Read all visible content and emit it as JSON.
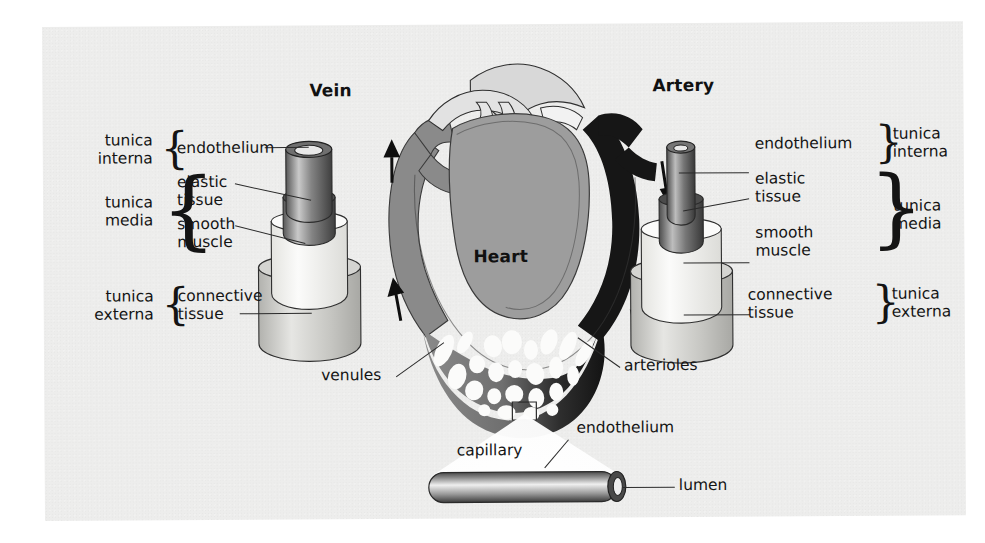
{
  "figure": {
    "background_color": "#ededec",
    "ink_color": "#141414"
  },
  "headings": {
    "vein": "Vein",
    "artery": "Artery",
    "heart": "Heart"
  },
  "vein_labels": {
    "tunica_interna": [
      "tunica",
      "interna"
    ],
    "tunica_media": [
      "tunica",
      "media"
    ],
    "tunica_externa": [
      "tunica",
      "externa"
    ],
    "endothelium": "endothelium",
    "elastic_tissue": [
      "elastic",
      "tissue"
    ],
    "smooth_muscle": [
      "smooth",
      "muscle"
    ],
    "connective_tissue": [
      "connective",
      "tissue"
    ]
  },
  "artery_labels": {
    "tunica_interna": [
      "tunica",
      "interna"
    ],
    "tunica_media": [
      "tunica",
      "media"
    ],
    "tunica_externa": [
      "tunica",
      "externa"
    ],
    "endothelium": "endothelium",
    "elastic_tissue": [
      "elastic",
      "tissue"
    ],
    "smooth_muscle": [
      "smooth",
      "muscle"
    ],
    "connective_tissue": [
      "connective",
      "tissue"
    ]
  },
  "vessel_bed": {
    "venules": "venules",
    "arterioles": "arterioles"
  },
  "capillary_inset": {
    "capillary": "capillary",
    "endothelium": "endothelium",
    "lumen": "lumen"
  },
  "colors": {
    "vein_flow": "#8a8a8a",
    "artery_flow": "#161616",
    "heart_chamber": "#9d9d9d",
    "great_vessels": "#d8d8d8",
    "tunica_interna_fill": "#6e6e6e",
    "tunica_media_fill": "#f4f4f2",
    "tunica_externa_fill": "#c9c9c7",
    "outline": "#2a2a2a"
  },
  "flow_arrows": {
    "left_direction": "up",
    "right_direction": "down",
    "left_count": 2,
    "right_count": 2
  }
}
